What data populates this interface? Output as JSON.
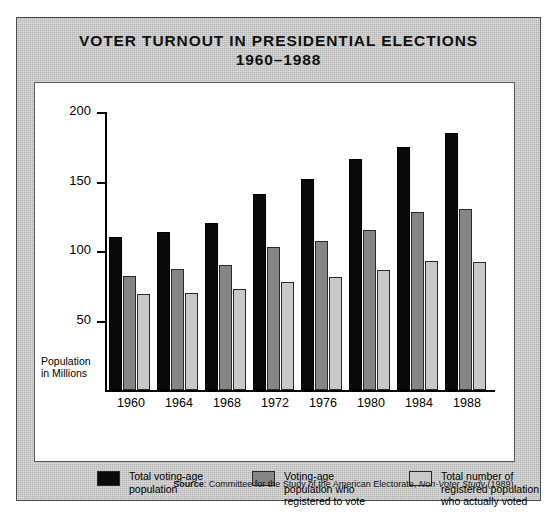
{
  "figure": {
    "title_line1": "VOTER TURNOUT IN PRESIDENTIAL ELECTIONS",
    "title_line2": "1960–1988",
    "axis_title_line1": "Population",
    "axis_title_line2": "in Millions",
    "source_label": "Source",
    "source_sep": ": ",
    "source_text": "Committee for the Study of the American Electorate, ",
    "source_italic": "Non-Voter Study",
    "source_year": " (1989)."
  },
  "colors": {
    "series_total_population": "#0a0a0a",
    "series_registered": "#858585",
    "series_voted": "#c9c9c9",
    "panel_background": "#c3c3c3",
    "plot_background": "#ffffff",
    "axis": "#000000"
  },
  "chart_data": {
    "type": "bar",
    "title": "VOTER TURNOUT IN PRESIDENTIAL ELECTIONS 1960–1988",
    "xlabel": "",
    "ylabel": "Population in Millions",
    "ylim": [
      0,
      200
    ],
    "yticks": [
      50,
      100,
      150,
      200
    ],
    "grid": false,
    "legend_position": "bottom",
    "categories": [
      "1960",
      "1964",
      "1968",
      "1972",
      "1976",
      "1980",
      "1984",
      "1988"
    ],
    "series": [
      {
        "name": "Total voting-age population",
        "legend_line1": "Total voting-age",
        "legend_line2": "population",
        "legend_line3": "",
        "color": "#0a0a0a",
        "values": [
          110,
          114,
          120,
          141,
          152,
          166,
          175,
          185
        ]
      },
      {
        "name": "Voting-age population who registered to vote",
        "legend_line1": "Voting-age",
        "legend_line2": "population who",
        "legend_line3": "registered to vote",
        "color": "#858585",
        "values": [
          82,
          87,
          90,
          103,
          107,
          115,
          128,
          130
        ]
      },
      {
        "name": "Total number of registered population who actually voted",
        "legend_line1": "Total number of",
        "legend_line2": "registered population",
        "legend_line3": "who actually voted",
        "color": "#c9c9c9",
        "values": [
          69,
          70,
          73,
          78,
          81,
          86,
          93,
          92
        ]
      }
    ]
  }
}
